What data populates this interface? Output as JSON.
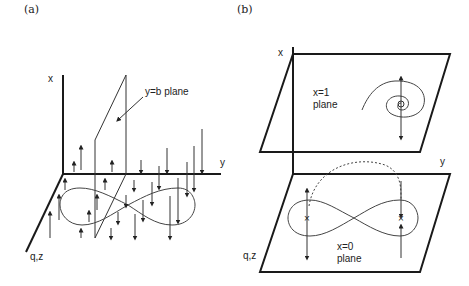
{
  "panels": [
    {
      "id": "a",
      "label": "(a)",
      "axes": {
        "x": "x",
        "y": "y",
        "qz": "q,z"
      },
      "annotation": "y=b plane"
    },
    {
      "id": "b",
      "label": "(b)",
      "axes": {
        "x": "x",
        "y": "y",
        "qz": "q,z"
      },
      "upper_plane_label": [
        "x=1",
        "plane"
      ],
      "lower_plane_label": [
        "x=0",
        "plane"
      ]
    }
  ],
  "colors": {
    "ink": "#1a1a1a",
    "background": "#ffffff"
  }
}
